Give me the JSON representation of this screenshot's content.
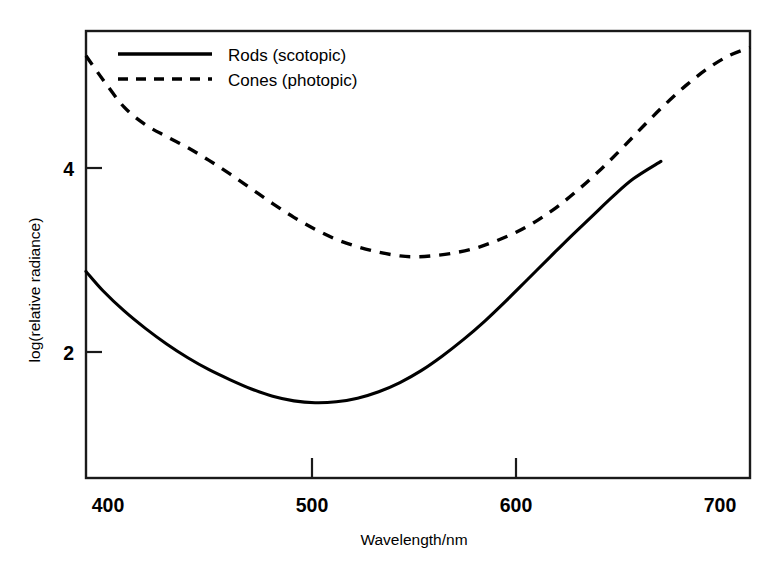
{
  "chart_data": {
    "type": "line",
    "title": "",
    "xlabel": "Wavelength/nm",
    "ylabel": "log(relative radiance)",
    "xlim": [
      397,
      710
    ],
    "ylim": [
      0.18,
      5.05
    ],
    "xticks": [
      400,
      500,
      600,
      700
    ],
    "xtick_labels": [
      "400",
      "500",
      "600",
      "700"
    ],
    "yticks": [
      2,
      4
    ],
    "ytick_labels": [
      "2",
      "4"
    ],
    "grid": false,
    "legend_position": "top-left-inside",
    "series": [
      {
        "name": "Rods (scotopic)",
        "style": "solid",
        "color": "#000000",
        "x": [
          397,
          405,
          415,
          425,
          435,
          445,
          455,
          465,
          475,
          485,
          495,
          505,
          515,
          525,
          535,
          545,
          555,
          565,
          575,
          585,
          595,
          605,
          615,
          625,
          635,
          645,
          655,
          668
        ],
        "y": [
          2.43,
          2.22,
          2.0,
          1.81,
          1.64,
          1.49,
          1.36,
          1.25,
          1.15,
          1.07,
          1.02,
          1.0,
          1.01,
          1.05,
          1.12,
          1.22,
          1.35,
          1.51,
          1.69,
          1.89,
          2.11,
          2.34,
          2.57,
          2.8,
          3.02,
          3.24,
          3.44,
          3.63
        ]
      },
      {
        "name": "Cones (photopic)",
        "style": "dashed",
        "color": "#000000",
        "x": [
          397,
          405,
          415,
          425,
          435,
          445,
          455,
          465,
          475,
          485,
          495,
          505,
          515,
          525,
          535,
          545,
          552,
          560,
          570,
          580,
          590,
          600,
          610,
          620,
          630,
          640,
          650,
          660,
          670,
          680,
          690,
          700,
          710
        ],
        "y": [
          4.78,
          4.52,
          4.22,
          4.03,
          3.9,
          3.78,
          3.64,
          3.49,
          3.33,
          3.17,
          3.02,
          2.89,
          2.78,
          2.7,
          2.64,
          2.6,
          2.59,
          2.6,
          2.63,
          2.68,
          2.76,
          2.86,
          2.99,
          3.15,
          3.34,
          3.55,
          3.78,
          4.02,
          4.25,
          4.46,
          4.64,
          4.78,
          4.87
        ]
      }
    ],
    "legend_entries": [
      {
        "label": "Rods (scotopic)",
        "style": "solid"
      },
      {
        "label": "Cones (photopic)",
        "style": "dashed"
      }
    ]
  },
  "axes": {
    "x_title": "Wavelength/nm",
    "y_title": "log(relative radiance)",
    "x_tick_labels": [
      "400",
      "500",
      "600",
      "700"
    ],
    "y_tick_labels": [
      "2",
      "4"
    ]
  },
  "legend": {
    "rods_label": "Rods (scotopic)",
    "cones_label": "Cones (photopic)"
  },
  "colors": {
    "axis": "#1a1a1a",
    "curve": "#000000",
    "background": "#ffffff"
  }
}
